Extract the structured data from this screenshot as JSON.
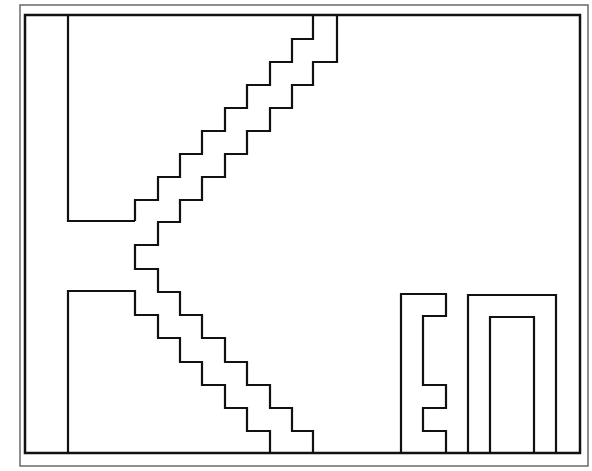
{
  "diagram": {
    "type": "line-drawing",
    "colors": {
      "background": "#ffffff",
      "outer_frame": "#6a6a6a",
      "lines": "#111111",
      "thin_lines": "#444444"
    },
    "outer_frame": {
      "x1": 20,
      "y1": 5,
      "x2": 588,
      "y2": 466
    },
    "inner_frame": {
      "x1": 25,
      "y1": 15,
      "x2": 580,
      "y2": 453
    },
    "shapes": [
      {
        "name": "upper-left-block",
        "points": "68,15 68,221 135,221"
      },
      {
        "name": "upper-left-staircase",
        "points": "135,221 135,200 158,200 158,177 180,177 180,154 202,154 202,131 225,131 225,108 247,108 247,85 270,85 270,62 292,62 292,39 313,39 313,15"
      },
      {
        "name": "central-staircase",
        "points": "337,15 337,62 313,62 313,85 292,85 292,108 270,108 270,131 247,131 247,154 225,154 225,177 202,177 202,200 180,200 180,222 158,222 158,245 135,245 135,269 158,269 158,292 180,292 180,315 202,315 202,338 225,338 225,362 247,362 247,385 270,385 270,408 292,408 292,431 313,431 313,453"
      },
      {
        "name": "lower-left-staircase",
        "points": "68,453 68,291 135,291 135,315 158,315 158,338 180,338 180,362 202,362 202,385 225,385 225,408 247,408 247,431 270,431 270,453"
      },
      {
        "name": "e-shape",
        "points": "401,453 401,294 446,294 446,316 423,316 423,385 446,385 446,408 423,408 423,431 446,431 446,453"
      },
      {
        "name": "outer-u-shape",
        "points": "468,453 468,295 556,295 556,453"
      },
      {
        "name": "inner-u-shape",
        "points": "490,453 490,317 534,317 534,453"
      }
    ]
  }
}
